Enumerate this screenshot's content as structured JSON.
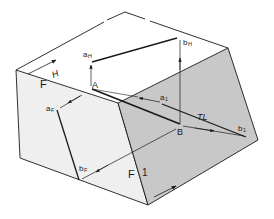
{
  "diagram": {
    "type": "descriptive-geometry-auxiliary-view",
    "colors": {
      "background": "#ffffff",
      "left_face": "#efefef",
      "top_face": "#ffffff",
      "aux_face": "#c8c8c8",
      "line": "#1a1a1a"
    },
    "planes": {
      "horizontal": "H",
      "frontal": "F",
      "frontal_fold": "F",
      "auxiliary": "1"
    },
    "points": {
      "a_h": "a",
      "a_h_sub": "H",
      "b_h": "b",
      "b_h_sub": "H",
      "a_f": "a",
      "a_f_sub": "F",
      "b_f": "b",
      "b_f_sub": "F",
      "a_1": "a",
      "a_1_sub": "1",
      "b_1": "b",
      "b_1_sub": "1",
      "A": "A",
      "B": "B"
    },
    "true_length_label": "TL"
  }
}
